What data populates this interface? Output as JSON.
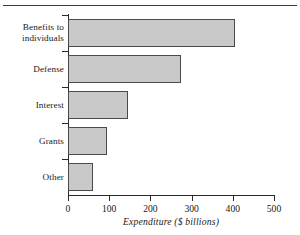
{
  "chart_data": {
    "type": "bar",
    "orientation": "horizontal",
    "title": "",
    "subtitle": "",
    "xlabel": "Expenditure ($ billions)",
    "ylabel": "",
    "categories": [
      "Benefits to individuals",
      "Defense",
      "Interest",
      "Grants",
      "Other"
    ],
    "values": [
      405,
      275,
      145,
      95,
      60
    ],
    "xlim": [
      0,
      500
    ],
    "xticks": [
      0,
      100,
      200,
      300,
      400,
      500
    ],
    "xtick_labels": [
      "0",
      "100",
      "200",
      "300",
      "400",
      "500"
    ],
    "grid": false,
    "legend": false,
    "series": [
      {
        "name": "Expenditure",
        "values": [
          405,
          275,
          145,
          95,
          60
        ]
      }
    ],
    "colors": {
      "bar_fill": "#c9c9c9",
      "bar_border": "#4a4a4a",
      "axis": "#2b2b2b",
      "text": "#1a1a1a",
      "background": "#ffffff",
      "top_rule": "#3a3a3a"
    },
    "category_label_lines": [
      [
        "Benefits to",
        "individuals"
      ],
      [
        "Defense"
      ],
      [
        "Interest"
      ],
      [
        "Grants"
      ],
      [
        "Other"
      ]
    ]
  },
  "figure": {
    "has_top_rule": true
  }
}
